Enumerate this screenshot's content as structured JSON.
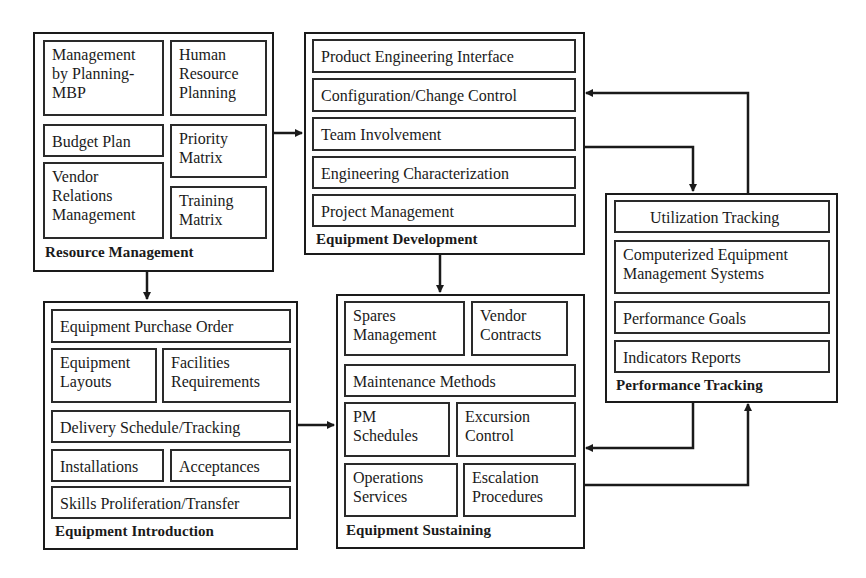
{
  "diagram": {
    "groups": {
      "resource_management": {
        "title": "Resource Management",
        "items": [
          "Management by Planning-MBP",
          "Human Resource Planning",
          "Budget Plan",
          "Priority Matrix",
          "Vendor Relations Management",
          "Training Matrix"
        ],
        "lines": {
          "mbp": [
            "Management",
            "by Planning-",
            "MBP"
          ],
          "hrp": [
            "Human",
            "Resource",
            "Planning"
          ],
          "budget": [
            "Budget Plan"
          ],
          "priority": [
            "Priority",
            "Matrix"
          ],
          "vendor": [
            "Vendor",
            "Relations",
            "Management"
          ],
          "training": [
            "Training",
            "Matrix"
          ]
        }
      },
      "equipment_development": {
        "title": "Equipment Development",
        "items": [
          "Product Engineering Interface",
          "Configuration/Change Control",
          "Team Involvement",
          "Engineering Characterization",
          "Project Management"
        ]
      },
      "performance_tracking": {
        "title": "Performance Tracking",
        "items": [
          "Utilization Tracking",
          "Computerized Equipment Management Systems",
          "Performance Goals",
          "Indicators Reports"
        ],
        "lines": {
          "cems": [
            "Computerized Equipment",
            "Management Systems"
          ]
        }
      },
      "equipment_introduction": {
        "title": "Equipment Introduction",
        "items": [
          "Equipment Purchase Order",
          "Equipment Layouts",
          "Facilities Requirements",
          "Delivery Schedule/Tracking",
          "Installations",
          "Acceptances",
          "Skills Proliferation/Transfer"
        ],
        "lines": {
          "layouts": [
            "Equipment",
            "Layouts"
          ],
          "facilities": [
            "Facilities",
            "Requirements"
          ]
        }
      },
      "equipment_sustaining": {
        "title": "Equipment Sustaining",
        "items": [
          "Spares Management",
          "Vendor Contracts",
          "Maintenance Methods",
          "PM Schedules",
          "Excursion Control",
          "Operations Services",
          "Escalation Procedures"
        ],
        "lines": {
          "spares": [
            "Spares",
            "Management"
          ],
          "vendor": [
            "Vendor",
            "Contracts"
          ],
          "pm": [
            "PM",
            "Schedules"
          ],
          "excursion": [
            "Excursion",
            "Control"
          ],
          "operations": [
            "Operations",
            "Services"
          ],
          "escalation": [
            "Escalation",
            "Procedures"
          ]
        }
      }
    },
    "connections": [
      {
        "from": "Resource Management",
        "to": "Equipment Development"
      },
      {
        "from": "Resource Management",
        "to": "Equipment Introduction"
      },
      {
        "from": "Equipment Development",
        "to": "Equipment Sustaining"
      },
      {
        "from": "Equipment Development",
        "to": "Performance Tracking"
      },
      {
        "from": "Performance Tracking",
        "to": "Equipment Development"
      },
      {
        "from": "Equipment Introduction",
        "to": "Equipment Sustaining"
      },
      {
        "from": "Performance Tracking",
        "to": "Equipment Sustaining"
      },
      {
        "from": "Equipment Sustaining",
        "to": "Performance Tracking"
      }
    ],
    "colors": {
      "line": "#1a1a1a",
      "background": "#ffffff"
    }
  }
}
